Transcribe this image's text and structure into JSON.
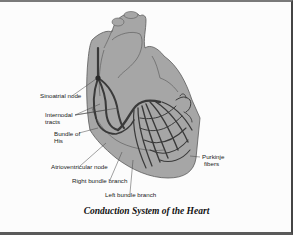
{
  "figure": {
    "title": "Conduction System of the Heart",
    "colors": {
      "heart_fill": "#a6a6a6",
      "outline": "#555555",
      "conduction": "#3a3a3a",
      "frame_top": "#7a7a7a",
      "frame_right": "#444444",
      "frame_bottom": "#5a5a5a"
    },
    "labels": {
      "sa_node": "Sinoatrial node",
      "internodal_1": "Internodal",
      "internodal_2": "tracts",
      "bundle_his_1": "Bundle of",
      "bundle_his_2": "His",
      "av_node": "Atrioventricular node",
      "right_bundle": "Right bundle branch",
      "left_bundle": "Left bundle branch",
      "purkinje_1": "Purkinje",
      "purkinje_2": "fibers"
    }
  }
}
